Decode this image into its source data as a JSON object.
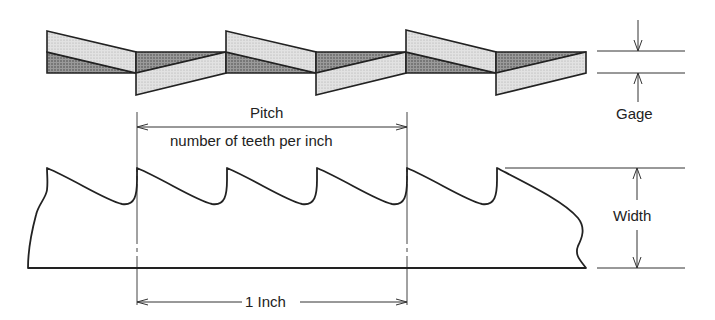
{
  "diagram": {
    "labels": {
      "pitch": "Pitch",
      "pitch_sub": "number of teeth per inch",
      "gage": "Gage",
      "width": "Width",
      "inch": "1 Inch"
    },
    "colors": {
      "light_fill": "#d9d9d9",
      "dark_fill": "#8c8c8c",
      "stroke": "#222222"
    }
  }
}
